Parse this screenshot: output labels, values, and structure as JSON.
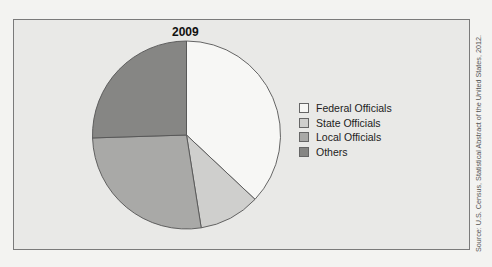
{
  "chart_data": {
    "type": "pie",
    "title": "2009",
    "categories": [
      "Federal Officials",
      "State Officials",
      "Local Officials",
      "Others"
    ],
    "values": [
      37,
      10.5,
      27,
      25.5
    ],
    "colors": [
      "#f7f7f5",
      "#cfcfcd",
      "#a9a9a7",
      "#868684"
    ],
    "start_angle": "top, clockwise",
    "legend_position": "right",
    "source": "Source: U.S. Census, Statistical Abstract of the United States, 2012."
  }
}
